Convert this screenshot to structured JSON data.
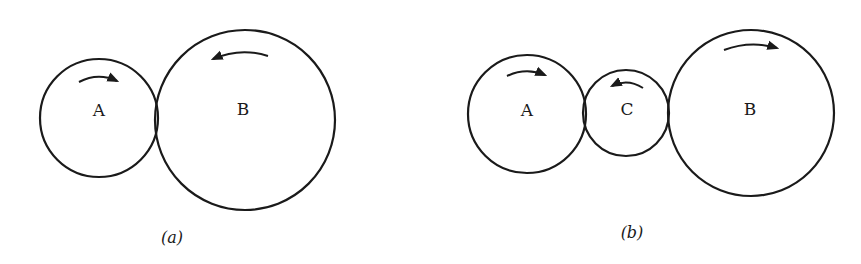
{
  "figures": [
    {
      "id": "a",
      "caption": "(a)",
      "caption_pos": [
        172,
        243
      ],
      "gears": [
        {
          "label": "A",
          "cx": 99,
          "cy": 118,
          "r": 59,
          "label_pos": [
            99,
            111
          ],
          "rotation": "clockwise",
          "arrow": {
            "x1": 79,
            "y1": 82,
            "x2": 117,
            "y2": 81,
            "ctrl_y": 72,
            "direction": "right"
          }
        },
        {
          "label": "B",
          "cx": 245,
          "cy": 120,
          "r": 90,
          "label_pos": [
            243,
            110
          ],
          "rotation": "counterclockwise",
          "arrow": {
            "x1": 268,
            "y1": 56,
            "x2": 213,
            "y2": 59,
            "ctrl_y": 47,
            "direction": "left"
          }
        }
      ]
    },
    {
      "id": "b",
      "caption": "(b)",
      "caption_pos": [
        632,
        238
      ],
      "gears": [
        {
          "label": "A",
          "cx": 527,
          "cy": 114,
          "r": 59,
          "label_pos": [
            527,
            111
          ],
          "rotation": "clockwise",
          "arrow": {
            "x1": 507,
            "y1": 76,
            "x2": 545,
            "y2": 75,
            "ctrl_y": 67,
            "direction": "right"
          }
        },
        {
          "label": "C",
          "cx": 626,
          "cy": 113,
          "r": 43,
          "label_pos": [
            627,
            110
          ],
          "rotation": "counterclockwise",
          "arrow": {
            "x1": 643,
            "y1": 88,
            "x2": 612,
            "y2": 86,
            "ctrl_y": 78,
            "direction": "left"
          }
        },
        {
          "label": "B",
          "cx": 751,
          "cy": 113,
          "r": 83,
          "label_pos": [
            750,
            110
          ],
          "rotation": "clockwise",
          "arrow": {
            "x1": 724,
            "y1": 50,
            "x2": 777,
            "y2": 48,
            "ctrl_y": 40,
            "direction": "right"
          }
        }
      ]
    }
  ],
  "colors": {
    "stroke": "#1a1a1a",
    "background": "#ffffff"
  }
}
